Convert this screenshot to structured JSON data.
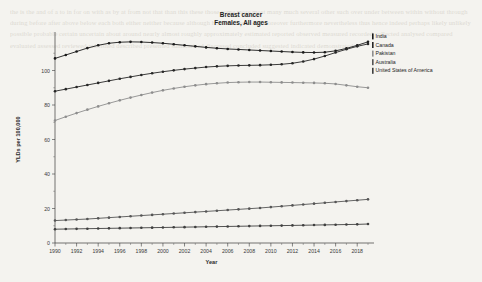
{
  "page": {
    "background_color": "#f4f3ef",
    "bleed_text": "the is the and of a to in for on with as by at from not that than this these those some more most many much several other such over under between within without through during before after above below each both either neither because although however therefore moreover furthermore nevertheless thus hence indeed perhaps likely unlikely possible probable certain uncertain about around nearly almost roughly approximately estimated reported observed measured recorded collected analysed compared evaluated assessed reviewed published described presented summarised discussed concluded suggested indicated demonstrated"
  },
  "title": {
    "line1": "Breast cancer",
    "line2": "Females, All ages"
  },
  "axes": {
    "x_label": "Year",
    "y_label": "YLDs per 100,000",
    "y_ticks": [
      "0",
      "20",
      "40",
      "60",
      "80",
      "100"
    ],
    "x_ticks": [
      "1990",
      "1992",
      "1994",
      "1996",
      "1998",
      "2000",
      "2002",
      "2004",
      "2006",
      "2008",
      "2010",
      "2012",
      "2014",
      "2016",
      "2018"
    ]
  },
  "legend": {
    "position": "right",
    "items": [
      {
        "label": "India",
        "color": "#1a1a1a"
      },
      {
        "label": "Canada",
        "color": "#262626"
      },
      {
        "label": "Pakistan",
        "color": "#8d8d8d"
      },
      {
        "label": "Australia",
        "color": "#555555"
      },
      {
        "label": "United States of America",
        "color": "#3f3f3f"
      }
    ]
  },
  "chart_data": {
    "type": "line",
    "subtitle": "Females, All ages",
    "xlabel": "Year",
    "ylabel": "YLDs per 100,000",
    "xlim": [
      1990,
      2019
    ],
    "ylim": [
      0,
      120
    ],
    "grid": false,
    "legend_position": "right",
    "markers": true,
    "x": [
      1990,
      1991,
      1992,
      1993,
      1994,
      1995,
      1996,
      1997,
      1998,
      1999,
      2000,
      2001,
      2002,
      2003,
      2004,
      2005,
      2006,
      2007,
      2008,
      2009,
      2010,
      2011,
      2012,
      2013,
      2014,
      2015,
      2016,
      2017,
      2018,
      2019
    ],
    "series": [
      {
        "name": "India",
        "color": "#1a1a1a",
        "values": [
          107.0,
          109.0,
          111.0,
          113.0,
          114.6,
          115.8,
          116.4,
          116.6,
          116.5,
          116.2,
          115.8,
          115.2,
          114.6,
          114.0,
          113.4,
          112.9,
          112.5,
          112.2,
          111.9,
          111.6,
          111.3,
          111.0,
          110.7,
          110.5,
          110.4,
          110.6,
          111.4,
          112.8,
          114.6,
          116.6
        ]
      },
      {
        "name": "Canada",
        "color": "#262626",
        "values": [
          88.0,
          89.2,
          90.4,
          91.6,
          92.8,
          94.0,
          95.2,
          96.3,
          97.4,
          98.4,
          99.3,
          100.1,
          100.8,
          101.4,
          102.0,
          102.4,
          102.7,
          102.9,
          103.0,
          103.1,
          103.3,
          103.6,
          104.2,
          105.2,
          106.6,
          108.4,
          110.4,
          112.3,
          114.0,
          115.4
        ]
      },
      {
        "name": "Pakistan",
        "color": "#8d8d8d",
        "values": [
          71.0,
          73.2,
          75.3,
          77.3,
          79.2,
          81.0,
          82.7,
          84.3,
          85.8,
          87.2,
          88.5,
          89.6,
          90.6,
          91.4,
          92.1,
          92.6,
          93.0,
          93.2,
          93.3,
          93.3,
          93.2,
          93.1,
          93.0,
          92.9,
          92.8,
          92.6,
          92.2,
          91.4,
          90.6,
          90.0
        ]
      },
      {
        "name": "Australia",
        "color": "#555555",
        "values": [
          13.0,
          13.3,
          13.6,
          13.9,
          14.3,
          14.7,
          15.1,
          15.5,
          15.9,
          16.3,
          16.7,
          17.1,
          17.5,
          17.9,
          18.3,
          18.7,
          19.1,
          19.5,
          19.9,
          20.3,
          20.8,
          21.3,
          21.8,
          22.3,
          22.8,
          23.3,
          23.8,
          24.3,
          24.8,
          25.3
        ]
      },
      {
        "name": "United States of America",
        "color": "#3f3f3f",
        "values": [
          8.0,
          8.1,
          8.2,
          8.3,
          8.4,
          8.5,
          8.6,
          8.7,
          8.8,
          8.9,
          9.0,
          9.1,
          9.2,
          9.3,
          9.4,
          9.5,
          9.6,
          9.7,
          9.8,
          9.9,
          10.0,
          10.1,
          10.2,
          10.3,
          10.4,
          10.5,
          10.6,
          10.7,
          10.8,
          11.0
        ]
      }
    ]
  }
}
